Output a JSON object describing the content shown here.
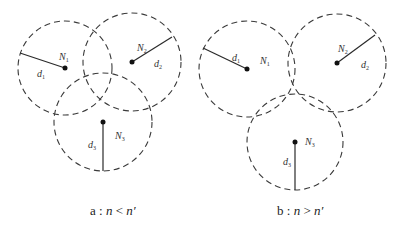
{
  "figure": {
    "panels": [
      {
        "id": "a",
        "caption": {
          "prefix": "a : ",
          "expr_left": "n",
          "op": " < ",
          "expr_right": "n′"
        },
        "nodes": [
          {
            "name": "N",
            "sub": "1",
            "radius_label": "d",
            "radius_sub": "1"
          },
          {
            "name": "N",
            "sub": "2",
            "radius_label": "d",
            "radius_sub": "2"
          },
          {
            "name": "N",
            "sub": "3",
            "radius_label": "d",
            "radius_sub": "3"
          }
        ]
      },
      {
        "id": "b",
        "caption": {
          "prefix": "b : ",
          "expr_left": "n",
          "op": " > ",
          "expr_right": "n′"
        },
        "nodes": [
          {
            "name": "N",
            "sub": "1",
            "radius_label": "d",
            "radius_sub": "1"
          },
          {
            "name": "N",
            "sub": "2",
            "radius_label": "d",
            "radius_sub": "2"
          },
          {
            "name": "N",
            "sub": "3",
            "radius_label": "d",
            "radius_sub": "3"
          }
        ]
      }
    ],
    "colors": {
      "stroke": "#3a3a3a",
      "dot": "#111111",
      "text": "#333333"
    }
  }
}
